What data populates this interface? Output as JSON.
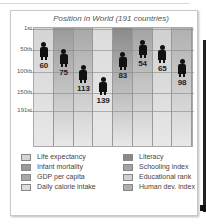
{
  "chart_data": {
    "type": "table",
    "title": "Position in World (191 countries)",
    "yticks": [
      "1st",
      "50th",
      "100th",
      "150th",
      "191st"
    ],
    "ytick_values": [
      1,
      50,
      100,
      150,
      191
    ],
    "ylim": [
      1,
      191
    ],
    "inverted_y": true,
    "categories": [
      "Life expectancy",
      "Infant mortality",
      "GDP per capita",
      "Daily calorie intake",
      "Literacy",
      "Schooling index",
      "Educational rank",
      "Human dev. index"
    ],
    "values": [
      60,
      75,
      113,
      139,
      83,
      54,
      65,
      98
    ],
    "colors": [
      "#d4d4d4",
      "#9a9a9a",
      "#a8a8a8",
      "#dcdcdc",
      "#8a8a8a",
      "#a4a4a4",
      "#d0d0d0",
      "#b0b0b0"
    ],
    "legend_position": "bottom",
    "grid": true
  },
  "labels": {
    "v0": "60",
    "v1": "75",
    "v2": "113",
    "v3": "139",
    "v4": "83",
    "v5": "54",
    "v6": "65",
    "v7": "98"
  }
}
